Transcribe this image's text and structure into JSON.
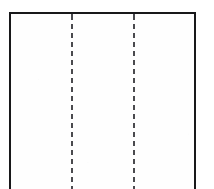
{
  "figure": {
    "kind": "line-drawing",
    "background_color": "#ffffff",
    "canvas": {
      "width": 214,
      "height": 189
    }
  },
  "outline": {
    "name": "panel-outline",
    "stroke_color": "#18181a",
    "stroke_width": 2,
    "left_x": 9,
    "right_x": 196,
    "top_y": 14,
    "bottom_edge_visible": false,
    "edges": [
      {
        "id": "top",
        "label": "top edge"
      },
      {
        "id": "left",
        "label": "left edge"
      },
      {
        "id": "right",
        "label": "right edge"
      }
    ]
  },
  "fold_lines": {
    "name": "fold-lines",
    "count": 2,
    "style": "dashed",
    "stroke_color": "#4a4a4e",
    "stroke_width": 2,
    "dash_length": 5,
    "gap_length": 4,
    "orientation": "vertical",
    "lines": [
      {
        "id": "fold-1",
        "label": "left fold line",
        "x": 73
      },
      {
        "id": "fold-2",
        "label": "right fold line",
        "x": 135
      }
    ]
  },
  "panels": [
    {
      "id": "panel-left",
      "label": "left panel",
      "fill": "#fefefe"
    },
    {
      "id": "panel-center",
      "label": "center panel",
      "fill": "#fefefe"
    },
    {
      "id": "panel-right",
      "label": "right panel",
      "fill": "#fefefe"
    }
  ]
}
